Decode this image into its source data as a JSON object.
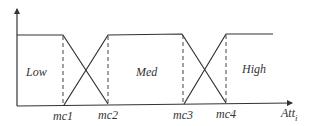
{
  "diagram": {
    "type": "fuzzy-membership-functions",
    "colors": {
      "line": "#333333",
      "dash": "#444444",
      "background": "#ffffff"
    },
    "axis": {
      "x_label": "Att",
      "x_label_subscript": "i",
      "y_label": ""
    },
    "regions": [
      {
        "label": "Low"
      },
      {
        "label": "Med"
      },
      {
        "label": "High"
      }
    ],
    "ticks": [
      {
        "label": "mc1"
      },
      {
        "label": "mc2"
      },
      {
        "label": "mc3"
      },
      {
        "label": "mc4"
      }
    ]
  }
}
